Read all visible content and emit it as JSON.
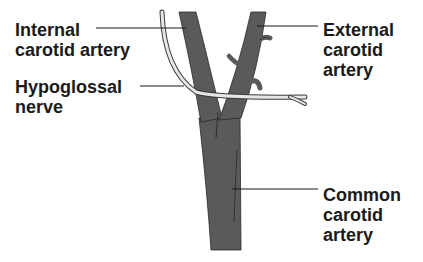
{
  "figure": {
    "labels": {
      "internal_carotid": {
        "line1": "Internal",
        "line2": "carotid artery"
      },
      "hypoglossal": {
        "line1": "Hypoglossal",
        "line2": "nerve"
      },
      "external_carotid": {
        "line1": "External",
        "line2": "carotid",
        "line3": "artery"
      },
      "common_carotid": {
        "line1": "Common",
        "line2": "carotid",
        "line3": "artery"
      }
    },
    "colors": {
      "artery_fill": "#5a5a5a",
      "artery_outline": "#2a2a2a",
      "nerve_fill": "#e6e6e6",
      "nerve_outline": "#3a3a3a",
      "text": "#1a1a1a",
      "background": "#ffffff"
    }
  }
}
